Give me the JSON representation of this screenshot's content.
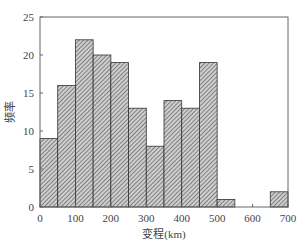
{
  "chart_data": {
    "type": "bar",
    "title": "",
    "xlabel": "变程(km)",
    "ylabel": "频率",
    "bin_edges": [
      0,
      50,
      100,
      150,
      200,
      250,
      300,
      350,
      400,
      450,
      500,
      550,
      600,
      650,
      700
    ],
    "categories": [
      "0-50",
      "50-100",
      "100-150",
      "150-200",
      "200-250",
      "250-300",
      "300-350",
      "350-400",
      "400-450",
      "450-500",
      "500-550",
      "550-600",
      "600-650",
      "650-700"
    ],
    "values": [
      9,
      16,
      22,
      20,
      19,
      13,
      8,
      14,
      13,
      19,
      1,
      0,
      0,
      2
    ],
    "xlim": [
      0,
      700
    ],
    "ylim": [
      0,
      25
    ],
    "xticks": [
      0,
      100,
      200,
      300,
      400,
      500,
      600,
      700
    ],
    "yticks": [
      0,
      5,
      10,
      15,
      20,
      25
    ],
    "grid": false,
    "bar_fill": "hatched"
  }
}
